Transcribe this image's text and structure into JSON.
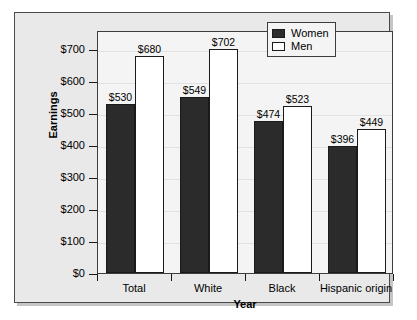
{
  "chart_data": {
    "type": "bar",
    "title": "",
    "subtitle": "",
    "xlabel": "Year",
    "ylabel": "Earnings",
    "categories": [
      "Total",
      "White",
      "Black",
      "Hispanic origin"
    ],
    "series": [
      {
        "name": "Women",
        "values": [
          530,
          549,
          474,
          396
        ],
        "color": "#2b2b2b"
      },
      {
        "name": "Men",
        "values": [
          680,
          702,
          523,
          449
        ],
        "color": "#ffffff"
      }
    ],
    "value_labels": [
      [
        "$530",
        "$680"
      ],
      [
        "$549",
        "$702"
      ],
      [
        "$474",
        "$523"
      ],
      [
        "$396",
        "$449"
      ]
    ],
    "ylim": [
      0,
      760
    ],
    "yticks": [
      0,
      100,
      200,
      300,
      400,
      500,
      600,
      700
    ],
    "ytick_labels": [
      "$0",
      "$100",
      "$200",
      "$300",
      "$400",
      "$500",
      "$600",
      "$700"
    ],
    "grid": true,
    "legend_position": "top-right",
    "legend_entries": [
      "Women",
      "Men"
    ]
  },
  "legend": {
    "women_label": "Women",
    "men_label": "Men"
  },
  "axes": {
    "y_title": "Earnings",
    "x_title": "Year"
  }
}
